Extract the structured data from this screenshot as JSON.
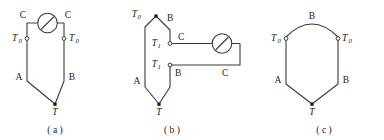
{
  "figure": {
    "background_color": "#ffffff",
    "line_color": "#3a3a3a",
    "text_color": "#1a1a1a",
    "panel_count": 3
  },
  "panels": [
    {
      "id": "a",
      "caption": "( a )",
      "description": "Thermocouple with meter in the compensating-lead branch between the two reference junctions",
      "labels": {
        "lead_left": "C",
        "lead_right": "C",
        "ref_left": "T",
        "ref_left_sub": "0",
        "ref_right": "T",
        "ref_right_sub": "0",
        "limb_left": "A",
        "limb_right": "B",
        "hot_junction": "T"
      },
      "meter": {
        "name": "galvanometer",
        "shape": "circle-with-needle"
      }
    },
    {
      "id": "b",
      "caption": "( b )",
      "description": "Thermocouple with compensating leads taken from intermediate junctions to an external meter",
      "labels": {
        "ref_top": "T",
        "ref_top_sub": "0",
        "limb_top_right": "B",
        "mid_upper": "T",
        "mid_upper_sub": "1",
        "lead_upper": "C",
        "mid_lower": "T",
        "mid_lower_sub": "1",
        "limb_lower_right": "B",
        "lead_lower": "C",
        "limb_left": "A",
        "hot_junction": "T"
      },
      "meter": {
        "name": "galvanometer",
        "shape": "circle-with-needle"
      }
    },
    {
      "id": "c",
      "caption": "( c )",
      "description": "Thermocouple with both reference junctions joined by a B-material arc, no meter shown",
      "labels": {
        "arc_top": "B",
        "ref_left": "T",
        "ref_left_sub": "0",
        "ref_right": "T",
        "ref_right_sub": "0",
        "limb_left": "A",
        "limb_right": "B",
        "hot_junction": "T"
      },
      "meter": null
    }
  ]
}
